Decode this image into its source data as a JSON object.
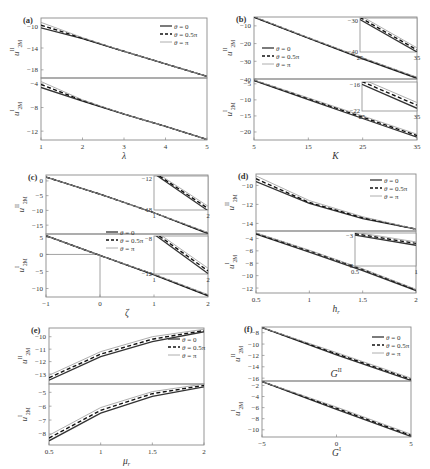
{
  "figure": {
    "legend_entries": [
      "θ = 0",
      "θ = 0.5π",
      "θ = π"
    ],
    "series_styles": [
      {
        "name": "θ = 0",
        "stroke": "#333333",
        "dash": "",
        "width": 1.3
      },
      {
        "name": "θ = 0.5π",
        "stroke": "#111111",
        "dash": "4,2.5",
        "width": 1.4
      },
      {
        "name": "θ = π",
        "stroke": "#999999",
        "dash": "",
        "width": 0.8
      }
    ],
    "axis_color": "#8a8a8a"
  },
  "chart_data": [
    {
      "id": "a",
      "label": "(a)",
      "type": "line",
      "xlabel": "λ",
      "xlim": [
        1,
        5
      ],
      "xticks": [
        1,
        2,
        3,
        4,
        5
      ],
      "box": {
        "x0": 41,
        "x1": 207,
        "top": 18,
        "mid": 78,
        "bottom": 140
      },
      "legend": {
        "x": 160,
        "y": 26,
        "pos": "top-right"
      },
      "upper": {
        "ylabel": "u^II_2M",
        "ylim": [
          -19.5,
          -8.5
        ],
        "yticks": [
          -10,
          -14,
          -18
        ],
        "x": [
          1,
          2,
          3,
          4,
          5
        ],
        "series": [
          {
            "name": "θ = 0",
            "values": [
              -10.3,
              -12.3,
              -14.6,
              -16.9,
              -19.2
            ]
          },
          {
            "name": "θ = 0.5π",
            "values": [
              -9.8,
              -12.2,
              -14.6,
              -16.9,
              -19.2
            ]
          },
          {
            "name": "θ = π",
            "values": [
              -9.3,
              -12.1,
              -14.6,
              -16.9,
              -19.2
            ]
          }
        ]
      },
      "lower": {
        "ylabel": "u^I_2M",
        "ylim": [
          -13.5,
          -3.0
        ],
        "yticks": [
          -4,
          -8,
          -12
        ],
        "x": [
          1,
          2,
          3,
          4,
          5
        ],
        "series": [
          {
            "name": "θ = 0",
            "values": [
              -4.6,
              -6.9,
              -9.1,
              -11.2,
              -13.4
            ]
          },
          {
            "name": "θ = 0.5π",
            "values": [
              -4.1,
              -6.8,
              -9.1,
              -11.2,
              -13.4
            ]
          },
          {
            "name": "θ = π",
            "values": [
              -3.6,
              -6.7,
              -9.1,
              -11.2,
              -13.4
            ]
          }
        ]
      }
    },
    {
      "id": "b",
      "label": "(b)",
      "type": "line",
      "xlabel": "K",
      "xlim": [
        5,
        35
      ],
      "xticks": [
        5,
        15,
        25,
        35
      ],
      "box": {
        "x0": 254,
        "x1": 417,
        "top": 17,
        "mid": 79,
        "bottom": 140
      },
      "legend": {
        "x": 262,
        "y": 48,
        "pos": "left"
      },
      "upper": {
        "ylabel": "u^II_2M",
        "ylim": [
          -40,
          -5
        ],
        "yticks": [
          -10,
          -20,
          -30,
          -40
        ],
        "x": [
          5,
          15,
          25,
          35
        ],
        "series": [
          {
            "name": "θ = 0",
            "values": [
              -5.2,
              -17.0,
              -28.6,
              -39.6
            ]
          },
          {
            "name": "θ = 0.5π",
            "values": [
              -5.0,
              -16.8,
              -28.3,
              -39.3
            ]
          },
          {
            "name": "θ = π",
            "values": [
              -4.8,
              -16.6,
              -28.0,
              -39.0
            ]
          }
        ],
        "inset": {
          "box": {
            "x0": 360,
            "x1": 417,
            "top": 18,
            "bottom": 52
          },
          "ylim": [
            -40,
            -28.5
          ],
          "xlim": [
            25,
            35
          ],
          "yticks": [
            -30,
            -40
          ],
          "xticks": [
            25,
            35
          ]
        }
      },
      "lower": {
        "ylabel": "u^I_2M",
        "ylim": [
          -22.5,
          -3.5
        ],
        "yticks": [
          -5,
          -10,
          -15,
          -20
        ],
        "x": [
          5,
          15,
          25,
          35
        ],
        "series": [
          {
            "name": "θ = 0",
            "values": [
              -4.0,
              -9.9,
              -15.8,
              -21.6
            ]
          },
          {
            "name": "θ = 0.5π",
            "values": [
              -3.9,
              -9.6,
              -15.4,
              -21.1
            ]
          },
          {
            "name": "θ = π",
            "values": [
              -3.8,
              -9.4,
              -15.0,
              -20.7
            ]
          }
        ],
        "inset": {
          "box": {
            "x0": 362,
            "x1": 417,
            "top": 82,
            "bottom": 111
          },
          "ylim": [
            -22.5,
            -15.5
          ],
          "xlim": [
            25,
            35
          ],
          "yticks": [
            -16,
            -22
          ],
          "xticks": [
            25,
            35
          ]
        }
      }
    },
    {
      "id": "c",
      "label": "(c)",
      "type": "line",
      "xlabel": "ζ",
      "xlim": [
        -1,
        2
      ],
      "xticks": [
        -1,
        0,
        1,
        2
      ],
      "box": {
        "x0": 46,
        "x1": 208,
        "top": 175,
        "mid": 234,
        "bottom": 297
      },
      "legend": {
        "x": 106,
        "y": 232,
        "pos": "center"
      },
      "upper": {
        "ylabel": "u^II_2M",
        "ylim": [
          -18,
          2
        ],
        "yticks": [
          0,
          -5,
          -10,
          -15
        ],
        "x": [
          -1,
          0,
          1,
          2
        ],
        "series": [
          {
            "name": "θ = 0",
            "values": [
              1.3,
              -4.5,
              -10.8,
              -17.9
            ]
          },
          {
            "name": "θ = 0.5π",
            "values": [
              1.3,
              -4.5,
              -10.8,
              -17.7
            ]
          },
          {
            "name": "θ = π",
            "values": [
              1.3,
              -4.5,
              -10.8,
              -17.5
            ]
          }
        ],
        "inset": {
          "box": {
            "x0": 154,
            "x1": 208,
            "top": 176,
            "bottom": 210
          },
          "ylim": [
            -18,
            -11.5
          ],
          "xlim": [
            1,
            2
          ],
          "yticks": [
            -12,
            -18
          ],
          "xticks": [
            1,
            2
          ]
        }
      },
      "lower": {
        "ylabel": "u^I_2M",
        "ylim": [
          -12.5,
          6
        ],
        "yticks": [
          5,
          0,
          -5,
          -10
        ],
        "x": [
          -1,
          0,
          1,
          2
        ],
        "series": [
          {
            "name": "θ = 0",
            "values": [
              5.5,
              -0.3,
              -6.0,
              -12.2
            ]
          },
          {
            "name": "θ = 0.5π",
            "values": [
              5.5,
              -0.3,
              -5.9,
              -12.0
            ]
          },
          {
            "name": "θ = π",
            "values": [
              5.5,
              -0.3,
              -5.8,
              -11.8
            ]
          }
        ],
        "inset": {
          "box": {
            "x0": 154,
            "x1": 208,
            "top": 236,
            "bottom": 274
          },
          "ylim": [
            -12.5,
            -6.5
          ],
          "xlim": [
            1,
            2
          ],
          "yticks": [
            -8,
            -12
          ],
          "xticks": [
            1,
            2
          ]
        },
        "guide_lines": [
          {
            "x": 0,
            "y": 0
          }
        ]
      }
    },
    {
      "id": "d",
      "label": "(d)",
      "type": "line",
      "xlabel": "h_r",
      "xlim": [
        0.5,
        2
      ],
      "xticks": [
        0.5,
        1,
        1.5,
        2
      ],
      "box": {
        "x0": 256,
        "x1": 416,
        "top": 174,
        "mid": 231,
        "bottom": 293
      },
      "legend": {
        "x": 370,
        "y": 180,
        "pos": "top-right"
      },
      "upper": {
        "ylabel": "u^II_2M",
        "ylim": [
          -14.8,
          -8.8
        ],
        "yticks": [
          -10,
          -12,
          -14
        ],
        "x": [
          0.5,
          1,
          1.5,
          2
        ],
        "series": [
          {
            "name": "θ = 0",
            "values": [
              -9.6,
              -11.9,
              -13.5,
              -14.6
            ]
          },
          {
            "name": "θ = 0.5π",
            "values": [
              -9.3,
              -11.8,
              -13.4,
              -14.6
            ]
          },
          {
            "name": "θ = π",
            "values": [
              -9.0,
              -11.6,
              -13.3,
              -14.6
            ]
          }
        ]
      },
      "lower": {
        "ylabel": "u^I_2M",
        "ylim": [
          -12.8,
          -2.8
        ],
        "yticks": [
          -4,
          -6,
          -8,
          -10,
          -12
        ],
        "x": [
          0.5,
          1,
          1.5,
          2
        ],
        "series": [
          {
            "name": "θ = 0",
            "values": [
              -3.3,
              -6.2,
              -9.2,
              -12.4
            ]
          },
          {
            "name": "θ = 0.5π",
            "values": [
              -3.2,
              -6.0,
              -9.0,
              -12.3
            ]
          },
          {
            "name": "θ = π",
            "values": [
              -3.1,
              -5.9,
              -8.9,
              -12.2
            ]
          }
        ],
        "inset": {
          "box": {
            "x0": 355,
            "x1": 416,
            "top": 233,
            "bottom": 266
          },
          "ylim": [
            -12.5,
            -3
          ],
          "xlim": [
            0.5,
            1
          ],
          "yticks": [
            -3,
            -8
          ],
          "xticks": [
            0.5,
            1
          ]
        }
      }
    },
    {
      "id": "e",
      "label": "(e)",
      "type": "line",
      "xlabel": "μ_r",
      "xlim": [
        0.5,
        2
      ],
      "xticks": [
        0.5,
        1,
        1.5,
        2
      ],
      "box": {
        "x0": 49,
        "x1": 204,
        "top": 328,
        "mid": 384,
        "bottom": 445
      },
      "legend": {
        "x": 168,
        "y": 339,
        "pos": "top-right"
      },
      "upper": {
        "ylabel": "u^II_2M",
        "ylim": [
          -13.8,
          -9.3
        ],
        "yticks": [
          -10,
          -11,
          -12,
          -13
        ],
        "x": [
          0.5,
          1,
          1.5,
          2
        ],
        "series": [
          {
            "name": "θ = 0",
            "values": [
              -13.5,
              -11.6,
              -10.4,
              -9.6
            ]
          },
          {
            "name": "θ = 0.5π",
            "values": [
              -13.3,
              -11.4,
              -10.2,
              -9.5
            ]
          },
          {
            "name": "θ = π",
            "values": [
              -13.1,
              -11.2,
              -10.0,
              -9.4
            ]
          }
        ]
      },
      "lower": {
        "ylabel": "u^I_2M",
        "ylim": [
          -8.8,
          -4.4
        ],
        "yticks": [
          -5,
          -6,
          -7,
          -8
        ],
        "x": [
          0.5,
          1,
          1.5,
          2
        ],
        "series": [
          {
            "name": "θ = 0",
            "values": [
              -8.5,
              -6.5,
              -5.3,
              -4.6
            ]
          },
          {
            "name": "θ = 0.5π",
            "values": [
              -8.3,
              -6.3,
              -5.1,
              -4.5
            ]
          },
          {
            "name": "θ = π",
            "values": [
              -8.1,
              -6.1,
              -4.95,
              -4.4
            ]
          }
        ]
      }
    },
    {
      "id": "f",
      "label": "(f)",
      "type": "line",
      "xlabel": "G^I",
      "xlim": [
        -5,
        5
      ],
      "xticks": [
        -5,
        0,
        5
      ],
      "box": {
        "x0": 262,
        "x1": 411,
        "top": 327,
        "mid": 381,
        "bottom": 437
      },
      "legend": {
        "x": 372,
        "y": 337,
        "pos": "top-right"
      },
      "upper": {
        "ylabel": "u^II_2M",
        "ylim": [
          -16.5,
          -7
        ],
        "yticks": [
          -8,
          -10,
          -12,
          -14,
          -16
        ],
        "x": [
          -5,
          0,
          5
        ],
        "annotation": "G^II",
        "series": [
          {
            "name": "θ = 0",
            "values": [
              -7.1,
              -11.9,
              -16.4
            ]
          },
          {
            "name": "θ = 0.5π",
            "values": [
              -7.1,
              -11.7,
              -16.2
            ]
          },
          {
            "name": "θ = π",
            "values": [
              -7.1,
              -11.5,
              -16.0
            ]
          }
        ]
      },
      "lower": {
        "ylabel": "u^I_2M",
        "ylim": [
          -11.3,
          -1.2
        ],
        "yticks": [
          -2,
          -4,
          -6,
          -8,
          -10
        ],
        "x": [
          -5,
          0,
          5
        ],
        "series": [
          {
            "name": "θ = 0",
            "values": [
              -1.3,
              -6.3,
              -11.2
            ]
          },
          {
            "name": "θ = 0.5π",
            "values": [
              -1.3,
              -6.1,
              -11.0
            ]
          },
          {
            "name": "θ = π",
            "values": [
              -1.3,
              -5.9,
              -10.8
            ]
          }
        ]
      }
    }
  ]
}
